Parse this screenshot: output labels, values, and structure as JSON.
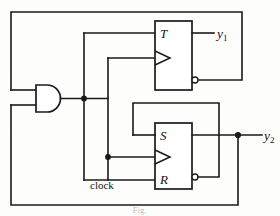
{
  "figure": {
    "type": "logic-circuit-diagram",
    "top_caption": "",
    "bottom_caption": "Fig."
  },
  "gates": {
    "and_gate": {
      "name": "AND",
      "inputs": 2,
      "output_junction": true
    }
  },
  "flipflops": [
    {
      "id": "t-flipflop",
      "kind": "T",
      "input_label": "T",
      "clock_label": "",
      "output_label": "Q",
      "inverted_output_label": "Q'",
      "has_clock_triangle": true,
      "has_output_bubble": true
    },
    {
      "id": "sr-flipflop",
      "kind": "SR",
      "set_label": "S",
      "reset_label": "R",
      "clock_label": "",
      "output_label": "Q",
      "inverted_output_label": "Q'",
      "has_clock_triangle": true,
      "has_output_bubble": true
    }
  ],
  "labels": {
    "t_input": "T",
    "s_input": "S",
    "r_input": "R",
    "clock": "clock",
    "output_1_base": "y",
    "output_1_sub": "1",
    "output_2_base": "y",
    "output_2_sub": "2"
  },
  "colors": {
    "wire": "#1a1a1a",
    "background": "#fdfdfc",
    "text": "#151515",
    "junction": "#1a1a1a"
  },
  "junction_count": 4
}
